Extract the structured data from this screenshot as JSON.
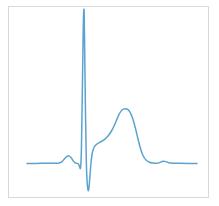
{
  "figure": {
    "background_color": "#ffffff",
    "frame_color": "#d9d9d9",
    "frame": {
      "x": 8,
      "y": 6,
      "width": 201,
      "height": 192
    }
  },
  "chart_data": {
    "type": "line",
    "title": "",
    "subtitle": "",
    "xlabel": "",
    "ylabel": "",
    "legend": [],
    "legend_position": "none",
    "grid": false,
    "axis_ticks_visible": false,
    "tick_labels_x": [],
    "tick_labels_y": [],
    "xlim": [
      0,
      201
    ],
    "ylim": [
      0,
      192
    ],
    "series": [
      {
        "name": "ECG lead trace",
        "color": "#5ba3cf",
        "line_width": 1.5,
        "points": [
          [
            27,
            163.5
          ],
          [
            36,
            163.4
          ],
          [
            45,
            163.3
          ],
          [
            54,
            163.2
          ],
          [
            59,
            163.0
          ],
          [
            62,
            161.6
          ],
          [
            64.5,
            158.8
          ],
          [
            67,
            156.3
          ],
          [
            69,
            155.9
          ],
          [
            71,
            157.6
          ],
          [
            73,
            160.6
          ],
          [
            75,
            162.8
          ],
          [
            77,
            163.4
          ],
          [
            78.5,
            163.9
          ],
          [
            79.6,
            166.8
          ],
          [
            80.6,
            167.4
          ],
          [
            81.4,
            150.0
          ],
          [
            82.2,
            100.0
          ],
          [
            83.0,
            45.0
          ],
          [
            83.6,
            14.0
          ],
          [
            84.2,
            14.0
          ],
          [
            84.8,
            60.0
          ],
          [
            85.6,
            120.0
          ],
          [
            86.4,
            165.0
          ],
          [
            87.2,
            183.0
          ],
          [
            88.0,
            190.0
          ],
          [
            88.8,
            189.0
          ],
          [
            89.8,
            178.0
          ],
          [
            91.0,
            163.0
          ],
          [
            92.5,
            152.0
          ],
          [
            94.5,
            146.5
          ],
          [
            97.0,
            144.0
          ],
          [
            100.0,
            142.2
          ],
          [
            104.0,
            139.8
          ],
          [
            108.0,
            136.0
          ],
          [
            111.5,
            131.0
          ],
          [
            114.5,
            125.0
          ],
          [
            117.0,
            119.0
          ],
          [
            119.5,
            113.5
          ],
          [
            122.0,
            110.0
          ],
          [
            125.0,
            108.8
          ],
          [
            128.0,
            109.6
          ],
          [
            130.5,
            113.0
          ],
          [
            133.0,
            119.5
          ],
          [
            135.5,
            128.5
          ],
          [
            138.0,
            139.0
          ],
          [
            140.5,
            148.5
          ],
          [
            143.0,
            155.5
          ],
          [
            146.0,
            160.0
          ],
          [
            149.5,
            162.3
          ],
          [
            153.0,
            163.0
          ],
          [
            157.0,
            163.2
          ],
          [
            160.0,
            162.4
          ],
          [
            163.0,
            161.2
          ],
          [
            166.0,
            161.6
          ],
          [
            169.0,
            162.8
          ],
          [
            173.0,
            163.2
          ],
          [
            180.0,
            163.3
          ],
          [
            188.0,
            163.4
          ],
          [
            197.0,
            163.5
          ]
        ]
      }
    ],
    "annotations": [
      {
        "label": "P wave",
        "x": 68,
        "y": 156
      },
      {
        "label": "Q",
        "x": 80,
        "y": 167
      },
      {
        "label": "R peak",
        "x": 84,
        "y": 14
      },
      {
        "label": "S",
        "x": 88,
        "y": 190
      },
      {
        "label": "T wave",
        "x": 125,
        "y": 109
      },
      {
        "label": "U wave",
        "x": 163,
        "y": 161
      },
      {
        "label": "baseline",
        "x": 27,
        "y": 163.5
      }
    ]
  }
}
